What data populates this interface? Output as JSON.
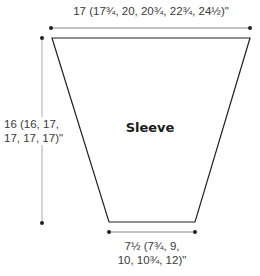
{
  "diagram": {
    "title": "Sleeve",
    "dimensions": {
      "top_width": "17 (17¾, 20, 20¾, 22¾, 24½)\"",
      "length_line1": "16 (16, 17,",
      "length_line2": "17, 17, 17)\"",
      "bottom_width_line1": "7½ (7¾, 9,",
      "bottom_width_line2": "10, 10¾, 12)\""
    },
    "colors": {
      "outline": "#222222",
      "dimension_line": "#888888",
      "text": "#3a3a3a"
    }
  }
}
